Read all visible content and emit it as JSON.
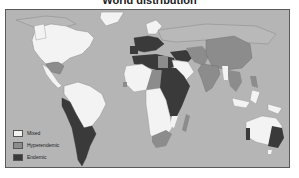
{
  "title": "World distribution",
  "colors": {
    "ocean": "#b5b5b5",
    "mixed": "#f3f3f3",
    "hyperendemic": "#8c8c8c",
    "endemic": "#3a3a3a",
    "border": "#5a5a5a",
    "coast": "#8f8f8f"
  },
  "legend": {
    "items": [
      {
        "label": "Mixed",
        "category": "mixed"
      },
      {
        "label": "Hyperendemic",
        "category": "hyperendemic"
      },
      {
        "label": "Endemic",
        "category": "endemic"
      }
    ]
  },
  "regions": {
    "mixed": [
      "North America",
      "Central America",
      "Brazil / northern South America",
      "West Africa",
      "Central & Southern Africa",
      "Saudi Arabia",
      "Australia (central/west)",
      "Greenland",
      "Scandinavia"
    ],
    "hyperendemic": [
      "Mexico",
      "China",
      "India",
      "Southeast Asia",
      "Madagascar",
      "South Africa",
      "Iran",
      "Chad"
    ],
    "endemic": [
      "Western Europe",
      "North Africa",
      "Sudan / East Africa",
      "Argentina / Chile / Peru",
      "Southeast Australia",
      "Western Australia coast",
      "Turkey / Middle East"
    ]
  }
}
